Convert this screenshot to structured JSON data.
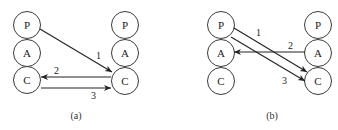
{
  "diagrams": [
    {
      "id": "a",
      "caption": "(a)",
      "left_column": [
        "P",
        "A",
        "C"
      ],
      "right_column": [
        "P",
        "A",
        "C"
      ],
      "edges": [
        {
          "label": "1",
          "from": "left.P",
          "to": "right.C"
        },
        {
          "label": "2",
          "from": "right.C",
          "to": "left.C"
        },
        {
          "label": "3",
          "from": "left.C",
          "to": "right.C"
        }
      ]
    },
    {
      "id": "b",
      "caption": "(b)",
      "left_column": [
        "P",
        "A",
        "C"
      ],
      "right_column": [
        "P",
        "A",
        "C"
      ],
      "edges": [
        {
          "label": "1",
          "from": "left.P",
          "to": "right.C"
        },
        {
          "label": "2",
          "from": "right.A",
          "to": "left.A"
        },
        {
          "label": "3",
          "from": "left.P",
          "to": "right.C"
        }
      ]
    }
  ],
  "colors": {
    "stroke": "#222222",
    "node_fill": "#ffffff"
  }
}
